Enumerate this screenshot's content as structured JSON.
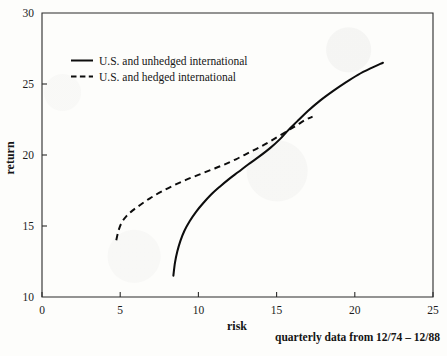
{
  "figure": {
    "background_color": "#fdfdfb",
    "ink_color": "#0d0d0d",
    "caption": "quarterly data from 12/74 – 12/88"
  },
  "chart_data": {
    "type": "line",
    "title": "",
    "xlabel": "risk",
    "ylabel": "return",
    "xlim": [
      0,
      25
    ],
    "ylim": [
      10,
      30
    ],
    "xticks": [
      0,
      5,
      10,
      15,
      20,
      25
    ],
    "yticks": [
      10,
      15,
      20,
      25,
      30
    ],
    "xtick_labels": [
      "0",
      "5",
      "10",
      "15",
      "20",
      "25"
    ],
    "ytick_labels": [
      "10",
      "15",
      "20",
      "25",
      "30"
    ],
    "grid": false,
    "legend_position": "upper left",
    "annotations": [
      "quarterly data from 12/74 – 12/88"
    ],
    "series": [
      {
        "name": "U.S. and unhedged international",
        "style": "solid",
        "color": "#0d0d0d",
        "points": [
          [
            8.4,
            11.5
          ],
          [
            8.5,
            12.4
          ],
          [
            8.65,
            13.2
          ],
          [
            8.85,
            13.95
          ],
          [
            9.1,
            14.65
          ],
          [
            9.45,
            15.35
          ],
          [
            9.85,
            16.0
          ],
          [
            10.3,
            16.6
          ],
          [
            10.8,
            17.2
          ],
          [
            11.35,
            17.75
          ],
          [
            11.95,
            18.3
          ],
          [
            12.55,
            18.8
          ],
          [
            13.2,
            19.35
          ],
          [
            13.9,
            19.9
          ],
          [
            14.6,
            20.5
          ],
          [
            15.2,
            21.1
          ],
          [
            15.7,
            21.7
          ],
          [
            16.3,
            22.35
          ],
          [
            17.0,
            23.1
          ],
          [
            17.8,
            23.85
          ],
          [
            18.6,
            24.5
          ],
          [
            19.4,
            25.1
          ],
          [
            20.2,
            25.65
          ],
          [
            21.0,
            26.1
          ],
          [
            21.8,
            26.5
          ]
        ]
      },
      {
        "name": "U.S. and hedged international",
        "style": "dashed",
        "color": "#0d0d0d",
        "points": [
          [
            4.75,
            14.0
          ],
          [
            4.9,
            14.7
          ],
          [
            5.1,
            15.25
          ],
          [
            5.4,
            15.7
          ],
          [
            5.8,
            16.1
          ],
          [
            6.3,
            16.5
          ],
          [
            6.9,
            16.95
          ],
          [
            7.6,
            17.4
          ],
          [
            8.4,
            17.85
          ],
          [
            9.2,
            18.25
          ],
          [
            10.0,
            18.6
          ],
          [
            10.8,
            18.95
          ],
          [
            11.6,
            19.3
          ],
          [
            12.4,
            19.7
          ],
          [
            13.2,
            20.15
          ],
          [
            14.0,
            20.6
          ],
          [
            14.8,
            21.1
          ],
          [
            15.7,
            21.7
          ],
          [
            16.3,
            22.1
          ],
          [
            16.8,
            22.45
          ],
          [
            17.3,
            22.7
          ]
        ]
      }
    ],
    "crossing_point": [
      15.7,
      21.7
    ]
  },
  "legend": {
    "items": [
      {
        "label": "U.S. and unhedged international",
        "style": "solid"
      },
      {
        "label": "U.S. and hedged international",
        "style": "dashed"
      }
    ]
  }
}
